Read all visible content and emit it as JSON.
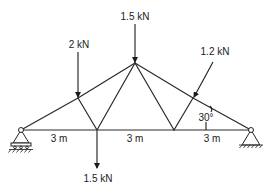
{
  "diagram": {
    "type": "truss",
    "loads": [
      {
        "id": "apex",
        "label": "1.5 kN",
        "direction": "down"
      },
      {
        "id": "left-top",
        "label": "2 kN",
        "direction": "down"
      },
      {
        "id": "right-top",
        "label": "1.2 kN",
        "direction": "inclined"
      },
      {
        "id": "bottom-left",
        "label": "1.5 kN",
        "direction": "down"
      }
    ],
    "spans": [
      {
        "label": "3 m"
      },
      {
        "label": "3 m"
      },
      {
        "label": "3 m"
      }
    ],
    "angle_label": "30°",
    "supports": [
      {
        "id": "left",
        "type": "roller"
      },
      {
        "id": "right",
        "type": "pin"
      }
    ]
  }
}
